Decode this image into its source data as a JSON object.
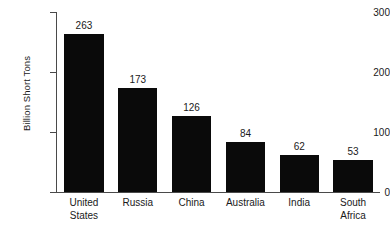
{
  "chart_data": {
    "type": "bar",
    "title": "",
    "xlabel": "",
    "ylabel": "Billion Short Tons",
    "ylim": [
      0,
      300
    ],
    "yticks": [
      0,
      100,
      200,
      300
    ],
    "ytick_labels": [
      "0",
      "100",
      "200",
      "300"
    ],
    "grid": false,
    "legend": false,
    "bar_color": "#0a0a0a",
    "background_color": "#ffffff",
    "axis_color": "#4a4a4a",
    "value_labels_shown": true,
    "categories": [
      "United States",
      "Russia",
      "China",
      "Australia",
      "India",
      "South Africa"
    ],
    "category_label_lines": [
      [
        "United",
        "States"
      ],
      [
        "Russia"
      ],
      [
        "China"
      ],
      [
        "Australia"
      ],
      [
        "India"
      ],
      [
        "South",
        "Africa"
      ]
    ],
    "values": [
      263,
      173,
      126,
      84,
      62,
      53
    ],
    "value_labels": [
      "263",
      "173",
      "126",
      "84",
      "62",
      "53"
    ]
  }
}
